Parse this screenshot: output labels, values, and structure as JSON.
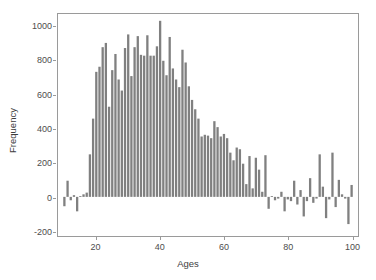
{
  "chart_data": {
    "type": "bar",
    "title": "",
    "subtitle": "",
    "xlabel": "Ages",
    "ylabel": "Frequency",
    "xlim": [
      8,
      102
    ],
    "ylim": [
      -230,
      1075
    ],
    "grid": false,
    "legend": null,
    "bar_color": "#808080",
    "axis_color": "#9a9a9a",
    "background": "#ffffff",
    "bar_width_years": 0.72,
    "baseline": 0,
    "xticks": [
      20,
      40,
      60,
      80,
      100
    ],
    "xtick_labels": [
      "20",
      "40",
      "60",
      "80",
      "100"
    ],
    "yticks": [
      -200,
      0,
      200,
      400,
      600,
      800,
      1000
    ],
    "ytick_labels": [
      "-200",
      "0",
      "200",
      "400",
      "600",
      "800",
      "1000"
    ],
    "categories": [
      10,
      11,
      12,
      13,
      14,
      15,
      16,
      17,
      18,
      19,
      20,
      21,
      22,
      23,
      24,
      25,
      26,
      27,
      28,
      29,
      30,
      31,
      32,
      33,
      34,
      35,
      36,
      37,
      38,
      39,
      40,
      41,
      42,
      43,
      44,
      45,
      46,
      47,
      48,
      49,
      50,
      51,
      52,
      53,
      54,
      55,
      56,
      57,
      58,
      59,
      60,
      61,
      62,
      63,
      64,
      65,
      66,
      67,
      68,
      69,
      70,
      71,
      72,
      73,
      74,
      75,
      76,
      77,
      78,
      79,
      80,
      81,
      82,
      83,
      84,
      85,
      86,
      87,
      88,
      89,
      90,
      91,
      92,
      93,
      94,
      95,
      96,
      97,
      98,
      99,
      100
    ],
    "values": [
      -55,
      95,
      -20,
      10,
      -85,
      5,
      15,
      25,
      250,
      460,
      735,
      765,
      880,
      905,
      530,
      745,
      840,
      690,
      625,
      875,
      955,
      710,
      880,
      945,
      835,
      830,
      950,
      830,
      830,
      885,
      1035,
      800,
      715,
      940,
      755,
      690,
      645,
      865,
      790,
      650,
      570,
      515,
      460,
      355,
      365,
      360,
      345,
      445,
      410,
      355,
      370,
      345,
      260,
      215,
      290,
      280,
      195,
      75,
      240,
      50,
      230,
      160,
      30,
      245,
      -70,
      5,
      -20,
      -10,
      30,
      -85,
      -15,
      -25,
      95,
      -45,
      40,
      -115,
      -25,
      110,
      -35,
      -10,
      250,
      60,
      -125,
      -15,
      260,
      -60,
      100,
      15,
      -10,
      -160,
      70
    ],
    "n_bars": 91,
    "max_value": 1035,
    "max_value_age": 40,
    "min_value": -160,
    "min_value_age": 99
  },
  "axes": {
    "x_title": "Ages",
    "y_title": "Frequency"
  }
}
